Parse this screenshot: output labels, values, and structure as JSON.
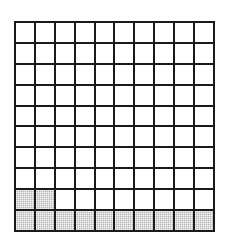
{
  "figure": {
    "type": "grid-diagram",
    "rows": 10,
    "columns": 10,
    "total_cells": 100,
    "shaded_count": 12,
    "unshaded_count": 88,
    "shaded_fraction": "12/100",
    "shaded_percent": "12%"
  },
  "colors": {
    "background": "#ffffff",
    "grid_line": "#1a1a1a",
    "cell_empty": "#ffffff",
    "cell_shaded": "#b4b4b4"
  },
  "chart_data": {
    "type": "heatmap",
    "title": "",
    "xlabel": "",
    "ylabel": "",
    "grid": true,
    "legend": "none",
    "rows": 10,
    "columns": 10,
    "values": [
      [
        0,
        0,
        0,
        0,
        0,
        0,
        0,
        0,
        0,
        0
      ],
      [
        0,
        0,
        0,
        0,
        0,
        0,
        0,
        0,
        0,
        0
      ],
      [
        0,
        0,
        0,
        0,
        0,
        0,
        0,
        0,
        0,
        0
      ],
      [
        0,
        0,
        0,
        0,
        0,
        0,
        0,
        0,
        0,
        0
      ],
      [
        0,
        0,
        0,
        0,
        0,
        0,
        0,
        0,
        0,
        0
      ],
      [
        0,
        0,
        0,
        0,
        0,
        0,
        0,
        0,
        0,
        0
      ],
      [
        0,
        0,
        0,
        0,
        0,
        0,
        0,
        0,
        0,
        0
      ],
      [
        0,
        0,
        0,
        0,
        0,
        0,
        0,
        0,
        0,
        0
      ],
      [
        1,
        1,
        0,
        0,
        0,
        0,
        0,
        0,
        0,
        0
      ],
      [
        1,
        1,
        1,
        1,
        1,
        1,
        1,
        1,
        1,
        1
      ]
    ],
    "row_shaded_counts": [
      0,
      0,
      0,
      0,
      0,
      0,
      0,
      0,
      2,
      10
    ],
    "column_shaded_counts": [
      2,
      2,
      1,
      1,
      1,
      1,
      1,
      1,
      1,
      1
    ]
  }
}
